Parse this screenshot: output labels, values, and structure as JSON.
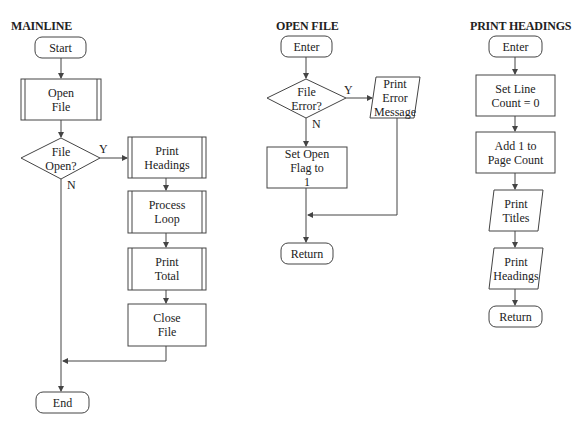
{
  "charts": [
    {
      "title": "MAINLINE",
      "nodes": {
        "start": "Start",
        "open_file": "Open\nFile",
        "decision": "File\nOpen?",
        "print_headings": "Print\nHeadings",
        "process_loop": "Process\nLoop",
        "print_total": "Print\nTotal",
        "close_file": "Close\nFile",
        "end": "End"
      },
      "labels": {
        "yes": "Y",
        "no": "N"
      }
    },
    {
      "title": "OPEN FILE",
      "nodes": {
        "enter": "Enter",
        "decision": "File\nError?",
        "print_error": "Print\nError\nMessage",
        "set_flag": "Set Open\nFlag to\n1",
        "return": "Return"
      },
      "labels": {
        "yes": "Y",
        "no": "N"
      }
    },
    {
      "title": "PRINT HEADINGS",
      "nodes": {
        "enter": "Enter",
        "set_line_count": "Set Line\nCount = 0",
        "add_page_count": "Add 1 to\nPage Count",
        "print_titles": "Print\nTitles",
        "print_headings": "Print\nHeadings",
        "return": "Return"
      }
    }
  ],
  "colors": {
    "stroke": "#444444",
    "text": "#222222",
    "background": "#ffffff"
  }
}
